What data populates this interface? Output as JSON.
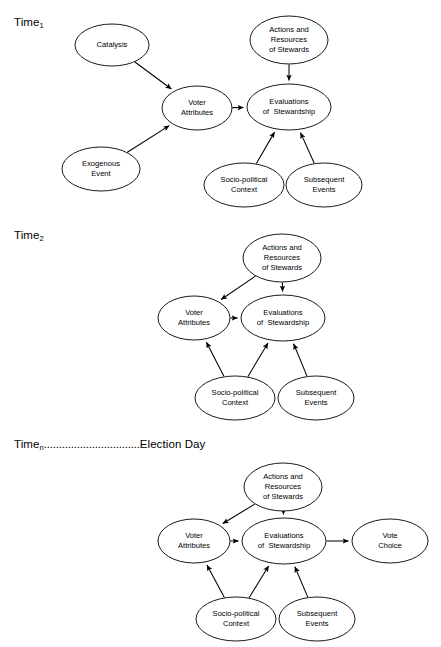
{
  "figure": {
    "type": "path-diagram",
    "panels": [
      {
        "id": "time1",
        "time_label_prefix": "Time",
        "time_label_sub": "1",
        "time_label_dots": "",
        "time_label_suffix": "",
        "nodes": [
          {
            "id": "catalysis",
            "label_lines": [
              "Catalysis"
            ],
            "cx": 112,
            "cy": 45,
            "rx": 37,
            "ry": 21
          },
          {
            "id": "exogenous-event",
            "label_lines": [
              "Exogenous",
              "Event"
            ],
            "cx": 101,
            "cy": 169,
            "rx": 39,
            "ry": 22
          },
          {
            "id": "voter-attributes",
            "label_lines": [
              "Voter",
              "Attributes"
            ],
            "cx": 197,
            "cy": 108,
            "rx": 35,
            "ry": 22
          },
          {
            "id": "actions-resources-of-stewards",
            "label_lines": [
              "Actions and",
              "Resources",
              "of Stewards"
            ],
            "cx": 289,
            "cy": 40,
            "rx": 39,
            "ry": 24
          },
          {
            "id": "evaluations-of-stewardship",
            "label_lines": [
              "Evaluations",
              "of  Stewardship"
            ],
            "cx": 289,
            "cy": 107,
            "rx": 42,
            "ry": 23
          },
          {
            "id": "socio-political-context",
            "label_lines": [
              "Socio-political",
              "Context"
            ],
            "cx": 244,
            "cy": 185,
            "rx": 40,
            "ry": 22
          },
          {
            "id": "subsequent-events",
            "label_lines": [
              "Subsequent",
              "Events"
            ],
            "cx": 324,
            "cy": 185,
            "rx": 38,
            "ry": 22
          }
        ],
        "edges": [
          {
            "from": "catalysis",
            "to": "voter-attributes"
          },
          {
            "from": "exogenous-event",
            "to": "voter-attributes"
          },
          {
            "from": "voter-attributes",
            "to": "evaluations-of-stewardship"
          },
          {
            "from": "actions-resources-of-stewards",
            "to": "evaluations-of-stewardship"
          },
          {
            "from": "socio-political-context",
            "to": "evaluations-of-stewardship"
          },
          {
            "from": "subsequent-events",
            "to": "evaluations-of-stewardship"
          }
        ]
      },
      {
        "id": "time2",
        "time_label_prefix": "Time",
        "time_label_sub": "2",
        "time_label_dots": "",
        "time_label_suffix": "",
        "nodes": [
          {
            "id": "actions-resources-of-stewards",
            "label_lines": [
              "Actions and",
              "Resources",
              "of Stewards"
            ],
            "cx": 282,
            "cy": 258,
            "rx": 39,
            "ry": 24
          },
          {
            "id": "voter-attributes",
            "label_lines": [
              "Voter",
              "Attributes"
            ],
            "cx": 194,
            "cy": 318,
            "rx": 36,
            "ry": 22
          },
          {
            "id": "evaluations-of-stewardship",
            "label_lines": [
              "Evaluations",
              "of  Stewardship"
            ],
            "cx": 283,
            "cy": 318,
            "rx": 42,
            "ry": 23
          },
          {
            "id": "socio-political-context",
            "label_lines": [
              "Socio-political",
              "Context"
            ],
            "cx": 235,
            "cy": 398,
            "rx": 40,
            "ry": 22
          },
          {
            "id": "subsequent-events",
            "label_lines": [
              "Subsequent",
              "Events"
            ],
            "cx": 316,
            "cy": 398,
            "rx": 38,
            "ry": 22
          }
        ],
        "edges": [
          {
            "from": "actions-resources-of-stewards",
            "to": "voter-attributes"
          },
          {
            "from": "actions-resources-of-stewards",
            "to": "evaluations-of-stewardship"
          },
          {
            "from": "voter-attributes",
            "to": "evaluations-of-stewardship"
          },
          {
            "from": "socio-political-context",
            "to": "voter-attributes"
          },
          {
            "from": "socio-political-context",
            "to": "evaluations-of-stewardship"
          },
          {
            "from": "subsequent-events",
            "to": "evaluations-of-stewardship"
          }
        ]
      },
      {
        "id": "timen",
        "time_label_prefix": "Time",
        "time_label_sub": "n",
        "time_label_dots": "................................",
        "time_label_suffix": "Election Day",
        "nodes": [
          {
            "id": "actions-resources-of-stewards",
            "label_lines": [
              "Actions and",
              "Resources",
              "of Stewards"
            ],
            "cx": 283,
            "cy": 487,
            "rx": 39,
            "ry": 24
          },
          {
            "id": "voter-attributes",
            "label_lines": [
              "Voter",
              "Attributes"
            ],
            "cx": 194,
            "cy": 541,
            "rx": 36,
            "ry": 22
          },
          {
            "id": "evaluations-of-stewardship",
            "label_lines": [
              "Evaluations",
              "of  Stewardship"
            ],
            "cx": 284,
            "cy": 541,
            "rx": 42,
            "ry": 23
          },
          {
            "id": "vote-choice",
            "label_lines": [
              "Vote",
              "Choice"
            ],
            "cx": 390,
            "cy": 541,
            "rx": 38,
            "ry": 22
          },
          {
            "id": "socio-political-context",
            "label_lines": [
              "Socio-political",
              "Context"
            ],
            "cx": 236,
            "cy": 619,
            "rx": 40,
            "ry": 22
          },
          {
            "id": "subsequent-events",
            "label_lines": [
              "Subsequent",
              "Events"
            ],
            "cx": 317,
            "cy": 619,
            "rx": 38,
            "ry": 22
          }
        ],
        "edges": [
          {
            "from": "actions-resources-of-stewards",
            "to": "voter-attributes"
          },
          {
            "from": "actions-resources-of-stewards",
            "to": "evaluations-of-stewardship"
          },
          {
            "from": "voter-attributes",
            "to": "evaluations-of-stewardship"
          },
          {
            "from": "evaluations-of-stewardship",
            "to": "vote-choice"
          },
          {
            "from": "socio-political-context",
            "to": "voter-attributes"
          },
          {
            "from": "socio-political-context",
            "to": "evaluations-of-stewardship"
          },
          {
            "from": "subsequent-events",
            "to": "evaluations-of-stewardship"
          }
        ]
      }
    ],
    "time_label_positions": [
      {
        "left": 14,
        "top": 16
      },
      {
        "left": 14,
        "top": 229
      },
      {
        "left": 14,
        "top": 438
      }
    ],
    "colors": {
      "stroke": "#000000",
      "fill": "#ffffff",
      "text": "#000000",
      "background": "#ffffff"
    }
  }
}
